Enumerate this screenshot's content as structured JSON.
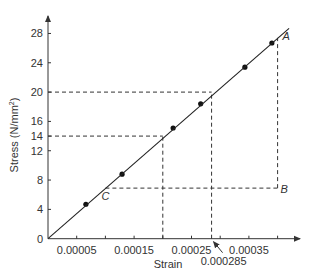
{
  "chart_data": {
    "type": "line",
    "title": "",
    "xlabel": "Strain",
    "ylabel": "Stress (N/mm²)",
    "ylabel_main": "Stress (N/mm",
    "ylabel_sup": "2",
    "ylabel_end": ")",
    "xlim": [
      0,
      0.00045
    ],
    "ylim": [
      0,
      30
    ],
    "grid": false,
    "legend": null,
    "x_ticks": [
      5e-05,
      0.0001,
      0.00015,
      0.0002,
      0.00025,
      0.0003,
      0.00035,
      0.0004
    ],
    "x_tick_labels": [
      {
        "value": 5e-05,
        "label": "0.00005"
      },
      {
        "value": 0.00015,
        "label": "0.00015"
      },
      {
        "value": 0.00025,
        "label": "0.00025"
      },
      {
        "value": 0.00035,
        "label": "0.00035"
      }
    ],
    "y_ticks": [
      0,
      4,
      8,
      12,
      14,
      16,
      20,
      24,
      28
    ],
    "y_tick_labels": [
      "0",
      "4",
      "8",
      "12",
      "14",
      "16",
      "20",
      "24",
      "28"
    ],
    "series": [
      {
        "name": "Measured points",
        "style": "markers",
        "x": [
          6.6e-05,
          0.000129,
          0.000218,
          0.000266,
          0.000343,
          0.00039
        ],
        "y": [
          4.7,
          8.8,
          15.1,
          18.4,
          23.4,
          26.7
        ]
      },
      {
        "name": "Best-fit line",
        "style": "line",
        "x": [
          0,
          0.00042
        ],
        "y": [
          0,
          28.7
        ]
      }
    ],
    "annotations": [
      {
        "label": "A",
        "x": 0.0004,
        "y": 27.4
      },
      {
        "label": "B",
        "x": 0.0004,
        "y": 6.9
      },
      {
        "label": "C",
        "x": 0.0001,
        "y": 6.9
      },
      {
        "label": "0.000285",
        "x": 0.000285,
        "y": 0,
        "note": "arrow pointing to strain at stress 20"
      }
    ],
    "guides": [
      {
        "type": "hline",
        "y": 20,
        "x_from": 0,
        "x_to": 0.000285
      },
      {
        "type": "vline",
        "x": 0.000285,
        "y_from": 0,
        "y_to": 20
      },
      {
        "type": "hline",
        "y": 14,
        "x_from": 0,
        "x_to": 0.0002
      },
      {
        "type": "vline",
        "x": 0.0002,
        "y_from": 0,
        "y_to": 14
      },
      {
        "type": "vline",
        "x": 0.0004,
        "y_from": 6.9,
        "y_to": 27.4,
        "label": "A-B"
      },
      {
        "type": "hline",
        "y": 6.9,
        "x_from": 0.0001,
        "x_to": 0.0004,
        "label": "C-B"
      }
    ],
    "colors": {
      "line": "#222222",
      "marker": "#111111",
      "dash": "#333333",
      "axis": "#333333"
    }
  }
}
